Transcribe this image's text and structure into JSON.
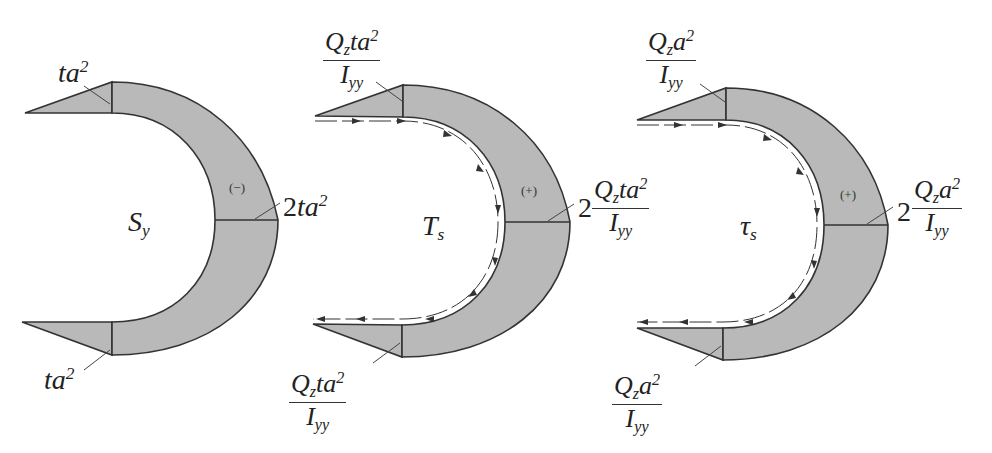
{
  "figure": {
    "panels": [
      {
        "id": "first-moment",
        "center_label": "S",
        "center_label_sub": "y",
        "sign": "(−)",
        "top_label": {
          "text": "ta",
          "sup": "2"
        },
        "bottom_label": {
          "text": "ta",
          "sup": "2"
        },
        "mid_label": {
          "coef": "2",
          "text": "ta",
          "sup": "2"
        }
      },
      {
        "id": "shear-flow",
        "center_label": "T",
        "center_label_sub": "s",
        "sign": "(+)",
        "top_label": {
          "num": "Q",
          "num_sub": "z",
          "num_rest": "ta",
          "num_sup": "2",
          "den": "I",
          "den_sub": "yy"
        },
        "bottom_label": {
          "num": "Q",
          "num_sub": "z",
          "num_rest": "ta",
          "num_sup": "2",
          "den": "I",
          "den_sub": "yy"
        },
        "mid_label": {
          "coef": "2",
          "num": "Q",
          "num_sub": "z",
          "num_rest": "ta",
          "num_sup": "2",
          "den": "I",
          "den_sub": "yy"
        }
      },
      {
        "id": "shear-stress",
        "center_label": "τ",
        "center_label_sub": "s",
        "sign": "(+)",
        "top_label": {
          "num": "Q",
          "num_sub": "z",
          "num_rest": "a",
          "num_sup": "2",
          "den": "I",
          "den_sub": "yy"
        },
        "bottom_label": {
          "num": "Q",
          "num_sub": "z",
          "num_rest": "a",
          "num_sup": "2",
          "den": "I",
          "den_sub": "yy"
        },
        "mid_label": {
          "coef": "2",
          "num": "Q",
          "num_sub": "z",
          "num_rest": "a",
          "num_sup": "2",
          "den": "I",
          "den_sub": "yy"
        }
      }
    ],
    "colors": {
      "fill": "#b9b9b9",
      "stroke": "#333333",
      "background": "#ffffff"
    }
  }
}
